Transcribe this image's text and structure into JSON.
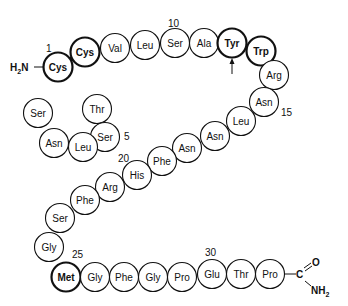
{
  "diagram": {
    "type": "peptide-sequence",
    "n_terminus": "H2N",
    "c_terminus": {
      "carbonyl": "C",
      "oxygen": "O",
      "amide": "NH2"
    },
    "residues": [
      {
        "index": 1,
        "name": "Cys",
        "bold": true,
        "x": 58,
        "y": 67
      },
      {
        "index": 2,
        "name": "Cys",
        "bold": true,
        "x": 85,
        "y": 52
      },
      {
        "index": 3,
        "name": "Thr",
        "bold": false,
        "x": 97,
        "y": 109
      },
      {
        "index": 4,
        "name": "Ser",
        "bold": false,
        "x": 105,
        "y": 137
      },
      {
        "index": 5,
        "name": "Leu",
        "bold": false,
        "x": 83,
        "y": 147
      },
      {
        "index": 6,
        "name": "Asn",
        "bold": false,
        "x": 54,
        "y": 143
      },
      {
        "index": 7,
        "name": "Ser",
        "bold": false,
        "x": 38,
        "y": 113
      },
      {
        "index": 8,
        "name": "Val",
        "bold": false,
        "x": 115,
        "y": 48
      },
      {
        "index": 9,
        "name": "Leu",
        "bold": false,
        "x": 145,
        "y": 45
      },
      {
        "index": 10,
        "name": "Ser",
        "bold": false,
        "x": 175,
        "y": 43
      },
      {
        "index": 11,
        "name": "Ala",
        "bold": false,
        "x": 204,
        "y": 43
      },
      {
        "index": 12,
        "name": "Tyr",
        "bold": true,
        "x": 232,
        "y": 43
      },
      {
        "index": 13,
        "name": "Trp",
        "bold": true,
        "x": 261,
        "y": 51
      },
      {
        "index": 14,
        "name": "Arg",
        "bold": false,
        "x": 274,
        "y": 75
      },
      {
        "index": 15,
        "name": "Asn",
        "bold": false,
        "x": 264,
        "y": 102
      },
      {
        "index": 16,
        "name": "Leu",
        "bold": false,
        "x": 241,
        "y": 121
      },
      {
        "index": 17,
        "name": "Asn",
        "bold": false,
        "x": 215,
        "y": 136
      },
      {
        "index": 18,
        "name": "Asn",
        "bold": false,
        "x": 187,
        "y": 148
      },
      {
        "index": 19,
        "name": "Phe",
        "bold": false,
        "x": 162,
        "y": 161
      },
      {
        "index": 20,
        "name": "His",
        "bold": false,
        "x": 137,
        "y": 175
      },
      {
        "index": 21,
        "name": "Arg",
        "bold": false,
        "x": 110,
        "y": 187
      },
      {
        "index": 22,
        "name": "Phe",
        "bold": false,
        "x": 85,
        "y": 200
      },
      {
        "index": 23,
        "name": "Ser",
        "bold": false,
        "x": 60,
        "y": 218
      },
      {
        "index": 24,
        "name": "Gly",
        "bold": false,
        "x": 49,
        "y": 247
      },
      {
        "index": 25,
        "name": "Met",
        "bold": true,
        "hatched": true,
        "x": 66,
        "y": 277
      },
      {
        "index": 26,
        "name": "Gly",
        "bold": false,
        "x": 95,
        "y": 277
      },
      {
        "index": 27,
        "name": "Phe",
        "bold": false,
        "x": 124,
        "y": 277
      },
      {
        "index": 28,
        "name": "Gly",
        "bold": false,
        "x": 153,
        "y": 277
      },
      {
        "index": 29,
        "name": "Pro",
        "bold": false,
        "x": 182,
        "y": 277
      },
      {
        "index": 30,
        "name": "Glu",
        "bold": false,
        "x": 212,
        "y": 274
      },
      {
        "index": 31,
        "name": "Thr",
        "bold": false,
        "x": 241,
        "y": 274
      },
      {
        "index": 32,
        "name": "Pro",
        "bold": false,
        "x": 270,
        "y": 274
      }
    ],
    "position_labels": [
      {
        "text": "1",
        "x": 46,
        "y": 52
      },
      {
        "text": "5",
        "x": 124,
        "y": 140
      },
      {
        "text": "10",
        "x": 168,
        "y": 27
      },
      {
        "text": "15",
        "x": 281,
        "y": 116
      },
      {
        "text": "20",
        "x": 118,
        "y": 162
      },
      {
        "text": "25",
        "x": 72,
        "y": 258
      },
      {
        "text": "30",
        "x": 205,
        "y": 256
      }
    ],
    "arrow": {
      "target": "Tyr",
      "x": 232,
      "y1": 74,
      "y2": 59
    }
  }
}
